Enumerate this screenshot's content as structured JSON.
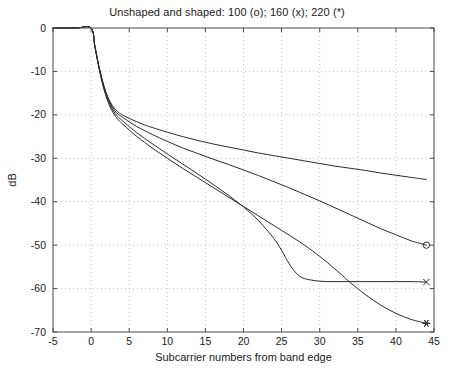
{
  "chart_data": {
    "type": "line",
    "title": "Unshaped and shaped: 100 (o); 160 (x); 220 (*)",
    "xlabel": "Subcarrier numbers from band edge",
    "ylabel": "dB",
    "xlim": [
      -5,
      45
    ],
    "ylim": [
      -70,
      0
    ],
    "xticks": [
      -5,
      0,
      5,
      10,
      15,
      20,
      25,
      30,
      35,
      40,
      45
    ],
    "xtick_labels": [
      "-5",
      "0",
      "5",
      "10",
      "15",
      "20",
      "25",
      "30",
      "35",
      "40",
      "45"
    ],
    "yticks": [
      0,
      -10,
      -20,
      -30,
      -40,
      -50,
      -60,
      -70
    ],
    "ytick_labels": [
      "0",
      "-10",
      "-20",
      "-30",
      "-40",
      "-50",
      "-60",
      "-70"
    ],
    "grid": true,
    "legend_position": "in-title",
    "series": [
      {
        "name": "Unshaped",
        "marker": "none",
        "marker_label": "",
        "x": [
          -5,
          -2,
          0,
          0.5,
          1,
          1.5,
          2,
          2.5,
          3,
          3.5,
          4,
          5,
          6,
          7,
          8,
          10,
          12,
          14,
          16,
          18,
          20,
          22,
          24,
          26,
          28,
          30,
          32,
          34,
          36,
          38,
          40,
          42,
          44
        ],
        "y": [
          0,
          0,
          0,
          -4.2,
          -8.6,
          -12.2,
          -15.0,
          -17.0,
          -18.4,
          -19.3,
          -19.9,
          -20.8,
          -21.6,
          -22.3,
          -22.9,
          -24.0,
          -25.0,
          -25.9,
          -26.7,
          -27.4,
          -28.1,
          -28.8,
          -29.4,
          -30.0,
          -30.6,
          -31.2,
          -31.8,
          -32.3,
          -32.8,
          -33.4,
          -33.9,
          -34.4,
          -34.9
        ]
      },
      {
        "name": "100",
        "marker": "o",
        "marker_label": "100 (o)",
        "marker_x": 44,
        "marker_y": -50.0,
        "x": [
          -5,
          -2,
          0,
          0.5,
          1,
          1.5,
          2,
          2.5,
          3,
          3.5,
          4,
          5,
          6,
          7,
          8,
          10,
          12,
          14,
          16,
          18,
          20,
          22,
          24,
          26,
          28,
          30,
          32,
          34,
          36,
          38,
          40,
          42,
          44
        ],
        "y": [
          0,
          0,
          0,
          -4.2,
          -8.6,
          -12.3,
          -15.2,
          -17.3,
          -18.8,
          -19.8,
          -20.4,
          -21.6,
          -22.7,
          -23.6,
          -24.5,
          -26.1,
          -27.6,
          -28.9,
          -30.2,
          -31.4,
          -32.7,
          -34.0,
          -35.4,
          -36.8,
          -38.3,
          -39.8,
          -41.4,
          -43.0,
          -44.6,
          -46.2,
          -47.6,
          -49.0,
          -50.0
        ]
      },
      {
        "name": "160",
        "marker": "x",
        "marker_label": "160 (x)",
        "marker_x": 44,
        "marker_y": -58.5,
        "x": [
          -5,
          -2,
          0,
          0.5,
          1,
          1.5,
          2,
          2.5,
          3,
          3.5,
          4,
          5,
          6,
          7,
          8,
          10,
          12,
          14,
          16,
          18,
          20,
          22,
          24,
          25,
          26,
          27,
          28,
          30,
          32,
          34,
          36,
          38,
          40,
          42,
          44
        ],
        "y": [
          0,
          0,
          0,
          -4.3,
          -8.8,
          -12.6,
          -15.5,
          -17.7,
          -19.3,
          -20.4,
          -21.2,
          -22.7,
          -24.1,
          -25.4,
          -26.6,
          -29.0,
          -31.3,
          -33.6,
          -36.0,
          -38.5,
          -41.2,
          -44.4,
          -48.5,
          -51.2,
          -54.3,
          -56.6,
          -57.7,
          -58.3,
          -58.4,
          -58.4,
          -58.4,
          -58.4,
          -58.4,
          -58.4,
          -58.5
        ]
      },
      {
        "name": "220",
        "marker": "*",
        "marker_label": "220 (*)",
        "marker_x": 44,
        "marker_y": -68.0,
        "x": [
          -5,
          -2,
          0,
          0.5,
          1,
          1.5,
          2,
          2.5,
          3,
          3.5,
          4,
          5,
          6,
          7,
          8,
          10,
          12,
          14,
          16,
          18,
          20,
          22,
          24,
          26,
          28,
          30,
          31,
          32,
          33,
          34,
          36,
          38,
          40,
          42,
          44
        ],
        "y": [
          0,
          0,
          0,
          -4.4,
          -9.0,
          -12.9,
          -15.9,
          -18.2,
          -19.8,
          -21.0,
          -21.9,
          -23.5,
          -25.0,
          -26.3,
          -27.6,
          -30.0,
          -32.3,
          -34.5,
          -36.7,
          -38.9,
          -41.1,
          -43.3,
          -45.5,
          -47.7,
          -50.0,
          -52.6,
          -54.0,
          -55.5,
          -57.0,
          -58.6,
          -61.4,
          -63.8,
          -65.7,
          -67.1,
          -68.0
        ]
      }
    ]
  }
}
